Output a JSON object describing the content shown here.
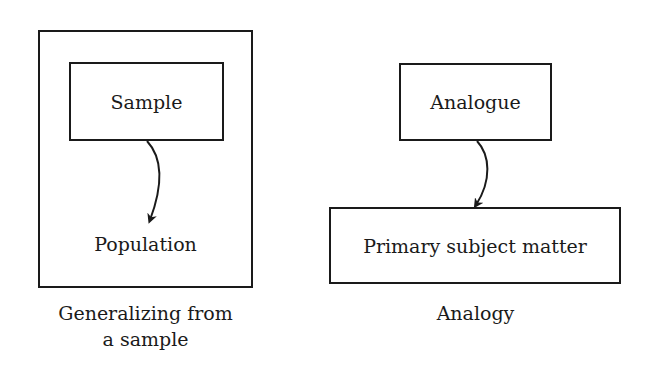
{
  "diagrams": [
    {
      "caption_lines": [
        "Generalizing from",
        "a sample"
      ],
      "nodes": {
        "source": "Sample",
        "target": "Population"
      },
      "edge": {
        "from": "Sample",
        "to": "Population",
        "style": "curved-arrow"
      }
    },
    {
      "caption_lines": [
        "Analogy"
      ],
      "nodes": {
        "source": "Analogue",
        "target": "Primary subject matter"
      },
      "edge": {
        "from": "Analogue",
        "to": "Primary subject matter",
        "style": "curved-arrow"
      }
    }
  ],
  "colors": {
    "stroke": "#1a1a1a",
    "background": "#ffffff"
  }
}
